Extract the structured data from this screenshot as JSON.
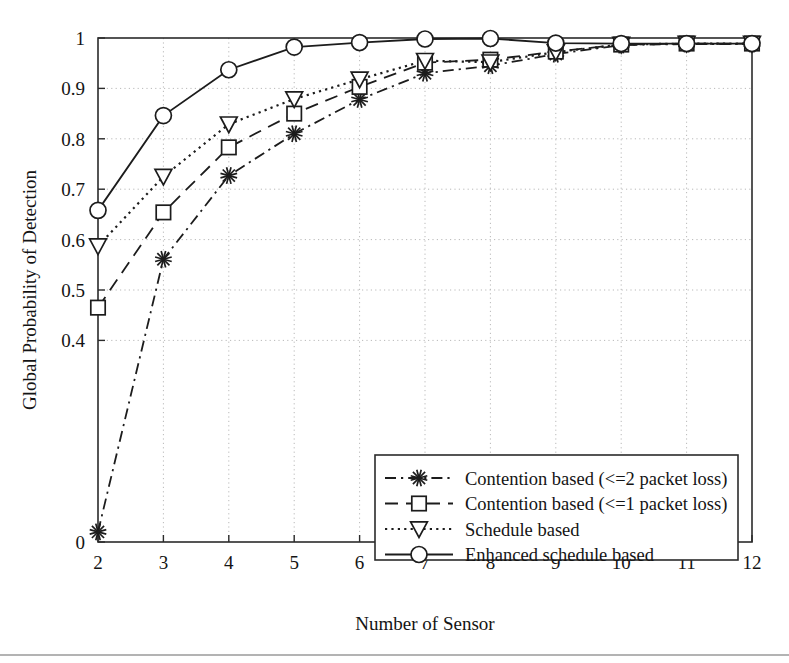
{
  "chart_data": {
    "type": "line",
    "title": "",
    "xlabel": "Number of Sensor",
    "ylabel": "Global Probability of Detection",
    "x": [
      2,
      3,
      4,
      5,
      6,
      7,
      8,
      9,
      10,
      11,
      12
    ],
    "xlim": [
      2,
      12
    ],
    "ylim": [
      0,
      1
    ],
    "xticks": [
      "2",
      "3",
      "4",
      "5",
      "6",
      "7",
      "8",
      "9",
      "10",
      "11",
      "12"
    ],
    "yticks": [
      "0",
      "0.4",
      "0.5",
      "0.6",
      "0.7",
      "0.8",
      "0.9",
      "1"
    ],
    "ytick_values": [
      0,
      0.4,
      0.5,
      0.6,
      0.7,
      0.8,
      0.9,
      1
    ],
    "grid": true,
    "grid_axis": "both",
    "legend_position": "lower-right-inside",
    "series": [
      {
        "name": "Contention based (<=2 packet loss)",
        "marker": "star",
        "linestyle": "dashdot",
        "color": "#1c1c1c",
        "values": [
          0.02,
          0.561,
          0.727,
          0.81,
          0.878,
          0.93,
          0.945,
          0.968,
          0.986,
          0.988,
          0.988
        ]
      },
      {
        "name": "Contention based (<=1 packet loss)",
        "marker": "square",
        "linestyle": "dashed",
        "color": "#1c1c1c",
        "values": [
          0.465,
          0.654,
          0.783,
          0.85,
          0.903,
          0.951,
          0.957,
          0.973,
          0.987,
          0.989,
          0.989
        ]
      },
      {
        "name": "Schedule based",
        "marker": "triangle-down",
        "linestyle": "dotted",
        "color": "#1c1c1c",
        "values": [
          0.587,
          0.725,
          0.829,
          0.879,
          0.918,
          0.955,
          0.952,
          0.972,
          0.987,
          0.989,
          0.989
        ]
      },
      {
        "name": "Enhanced schedule based",
        "marker": "circle",
        "linestyle": "solid",
        "color": "#1c1c1c",
        "values": [
          0.658,
          0.846,
          0.937,
          0.982,
          0.991,
          0.998,
          0.999,
          0.99,
          0.989,
          0.989,
          0.989
        ]
      }
    ]
  },
  "axes": {
    "x_title": "Number of Sensor",
    "y_title": "Global Probability of Detection"
  },
  "legend": {
    "entries": [
      {
        "label": "Contention based (<=2 packet loss)",
        "marker": "star",
        "linestyle": "dashdot"
      },
      {
        "label": "Contention based (<=1 packet loss)",
        "marker": "square",
        "linestyle": "dashed"
      },
      {
        "label": "Schedule based",
        "marker": "triangle-down",
        "linestyle": "dotted"
      },
      {
        "label": "Enhanced schedule based",
        "marker": "circle",
        "linestyle": "solid"
      }
    ]
  }
}
